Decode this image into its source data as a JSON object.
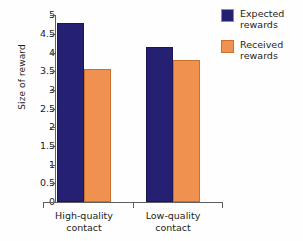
{
  "chart_data": {
    "type": "bar",
    "title": "",
    "xlabel": "",
    "ylabel": "Size of reward",
    "ylim": [
      0,
      5
    ],
    "ytick_labels": [
      "5",
      "4.5",
      "4",
      "3.5",
      "3",
      "2.5",
      "2",
      "1.5",
      "1",
      "0.5",
      "0"
    ],
    "ytick_values": [
      5,
      4.5,
      4,
      3.5,
      3,
      2.5,
      2,
      1.5,
      1,
      0.5,
      0
    ],
    "grid": false,
    "legend_position": "right-top",
    "categories": [
      "High-quality contact",
      "Low-quality contact"
    ],
    "category_lines": [
      {
        "line1": "High-quality",
        "line2": "contact"
      },
      {
        "line1": "Low-quality",
        "line2": "contact"
      }
    ],
    "series": [
      {
        "name": "Expected rewards",
        "name_lines": {
          "line1": "Expected",
          "line2": "rewards"
        },
        "color": "#262073",
        "values": [
          4.8,
          4.15
        ]
      },
      {
        "name": "Received rewards",
        "name_lines": {
          "line1": "Received",
          "line2": "rewards"
        },
        "color": "#f0914f",
        "values": [
          3.55,
          3.8
        ]
      }
    ]
  },
  "colors": {
    "expected": "#262073",
    "received": "#f0914f",
    "axis": "#5f5f63",
    "text": "#231f20",
    "background": "#fefefe"
  }
}
